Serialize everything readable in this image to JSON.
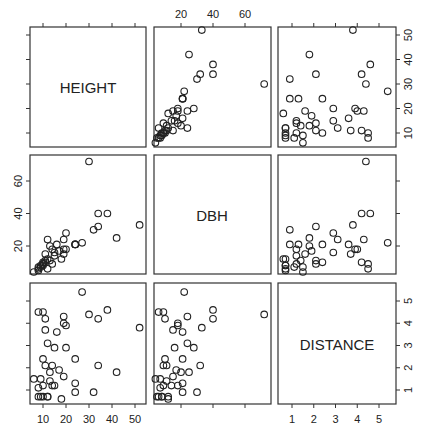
{
  "chart_data": {
    "type": "scatter",
    "title": "",
    "layout": "scatterplot matrix (3x3), variable names on diagonal",
    "variables": [
      "HEIGHT",
      "DBH",
      "DISTANCE"
    ],
    "axes": {
      "HEIGHT": {
        "ticks": [
          10,
          20,
          30,
          40,
          50
        ],
        "range": [
          5,
          54
        ]
      },
      "DBH": {
        "ticks": [
          20,
          40,
          60
        ],
        "range": [
          3,
          75
        ]
      },
      "DISTANCE": {
        "ticks": [
          1,
          2,
          3,
          4,
          5
        ],
        "range": [
          0.5,
          5.6
        ]
      }
    },
    "tick_label_positions": {
      "top": "DBH (column 2)",
      "right_top": "HEIGHT (row 1)",
      "left_middle": "DBH (row 2)",
      "bottom_left": "HEIGHT (column 1)",
      "right_bottom": "DISTANCE (row 3)",
      "bottom_right": "DISTANCE (column 3)"
    },
    "points": [
      {
        "HEIGHT": 52,
        "DBH": 33,
        "DISTANCE": 3.8
      },
      {
        "HEIGHT": 42,
        "DBH": 25,
        "DISTANCE": 1.8
      },
      {
        "HEIGHT": 38,
        "DBH": 40,
        "DISTANCE": 4.6
      },
      {
        "HEIGHT": 34,
        "DBH": 40,
        "DISTANCE": 4.2
      },
      {
        "HEIGHT": 34,
        "DBH": 32,
        "DISTANCE": 2.1
      },
      {
        "HEIGHT": 32,
        "DBH": 30,
        "DISTANCE": 0.9
      },
      {
        "HEIGHT": 30,
        "DBH": 72,
        "DISTANCE": 4.4
      },
      {
        "HEIGHT": 27,
        "DBH": 22,
        "DISTANCE": 5.4
      },
      {
        "HEIGHT": 24,
        "DBH": 21,
        "DISTANCE": 2.4
      },
      {
        "HEIGHT": 24,
        "DBH": 21,
        "DISTANCE": 1.3
      },
      {
        "HEIGHT": 24,
        "DBH": 21,
        "DISTANCE": 0.9
      },
      {
        "HEIGHT": 20,
        "DBH": 28,
        "DISTANCE": 2.9
      },
      {
        "HEIGHT": 20,
        "DBH": 18,
        "DISTANCE": 3.9
      },
      {
        "HEIGHT": 19,
        "DBH": 18,
        "DISTANCE": 4.0
      },
      {
        "HEIGHT": 19,
        "DBH": 15,
        "DISTANCE": 1.6
      },
      {
        "HEIGHT": 19,
        "DBH": 24,
        "DISTANCE": 4.3
      },
      {
        "HEIGHT": 18,
        "DBH": 12,
        "DISTANCE": 0.6
      },
      {
        "HEIGHT": 17,
        "DBH": 17,
        "DISTANCE": 1.9
      },
      {
        "HEIGHT": 16,
        "DBH": 21,
        "DISTANCE": 3.6
      },
      {
        "HEIGHT": 15,
        "DBH": 16,
        "DISTANCE": 2.9
      },
      {
        "HEIGHT": 15,
        "DBH": 14,
        "DISTANCE": 1.2
      },
      {
        "HEIGHT": 14,
        "DBH": 18,
        "DISTANCE": 1.2
      },
      {
        "HEIGHT": 14,
        "DBH": 9,
        "DISTANCE": 2.1
      },
      {
        "HEIGHT": 13,
        "DBH": 20,
        "DISTANCE": 1.8
      },
      {
        "HEIGHT": 13,
        "DBH": 11,
        "DISTANCE": 1.4
      },
      {
        "HEIGHT": 12,
        "DBH": 12,
        "DISTANCE": 0.7
      },
      {
        "HEIGHT": 12,
        "DBH": 24,
        "DISTANCE": 3.1
      },
      {
        "HEIGHT": 12,
        "DBH": 6,
        "DISTANCE": 0.7
      },
      {
        "HEIGHT": 11,
        "DBH": 11,
        "DISTANCE": 2.1
      },
      {
        "HEIGHT": 11,
        "DBH": 10,
        "DISTANCE": 4.2
      },
      {
        "HEIGHT": 11,
        "DBH": 15,
        "DISTANCE": 3.7
      },
      {
        "HEIGHT": 10,
        "DBH": 9,
        "DISTANCE": 4.5
      },
      {
        "HEIGHT": 10,
        "DBH": 10,
        "DISTANCE": 2.4
      },
      {
        "HEIGHT": 10,
        "DBH": 9,
        "DISTANCE": 1.2
      },
      {
        "HEIGHT": 10,
        "DBH": 8,
        "DISTANCE": 0.7
      },
      {
        "HEIGHT": 9,
        "DBH": 7,
        "DISTANCE": 1.5
      },
      {
        "HEIGHT": 9,
        "DBH": 8,
        "DISTANCE": 0.7
      },
      {
        "HEIGHT": 8,
        "DBH": 6,
        "DISTANCE": 4.5
      },
      {
        "HEIGHT": 8,
        "DBH": 7,
        "DISTANCE": 1.1
      },
      {
        "HEIGHT": 8,
        "DBH": 5,
        "DISTANCE": 0.7
      },
      {
        "HEIGHT": 6,
        "DBH": 4,
        "DISTANCE": 1.5
      }
    ],
    "grid": false,
    "legend": null,
    "marker": "open circle"
  },
  "labels": {
    "diag": [
      "HEIGHT",
      "DBH",
      "DISTANCE"
    ]
  }
}
